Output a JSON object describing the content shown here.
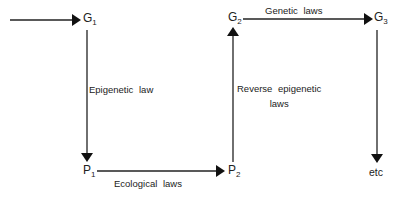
{
  "nodes": {
    "g1": {
      "base": "G",
      "sub": "1"
    },
    "g2": {
      "base": "G",
      "sub": "2"
    },
    "g3": {
      "base": "G",
      "sub": "3"
    },
    "p1": {
      "base": "P",
      "sub": "1"
    },
    "p2": {
      "base": "P",
      "sub": "2"
    },
    "etc": "etc"
  },
  "edges": {
    "g1_p1": "Epigenetic law",
    "p1_p2": "Ecological laws",
    "p2_g2_line1": "Reverse epigenetic",
    "p2_g2_line2": "laws",
    "g2_g3": "Genetic laws"
  },
  "colors": {
    "line": "#222222",
    "background": "#ffffff"
  }
}
